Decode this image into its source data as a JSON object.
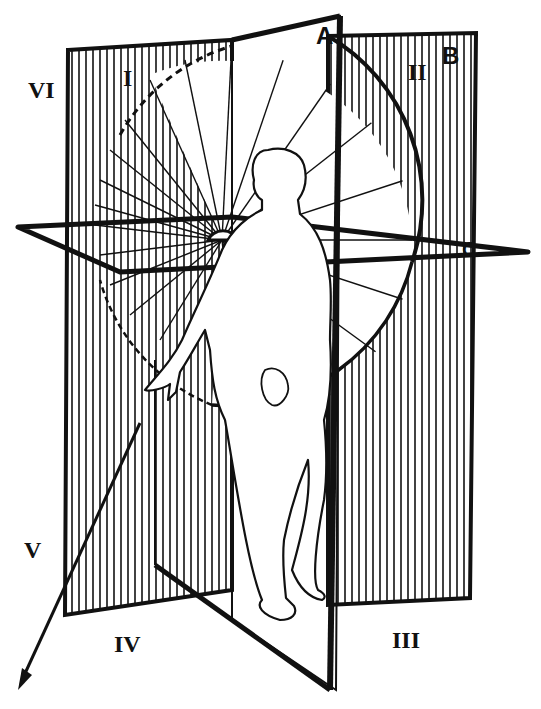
{
  "diagram": {
    "type": "anatomical-planes",
    "colors": {
      "ink": "#111111",
      "paper": "#ffffff"
    },
    "planes": [
      {
        "id": "A",
        "label": "A",
        "name": "sagittal-plane"
      },
      {
        "id": "B",
        "label": "B",
        "name": "frontal-plane"
      },
      {
        "id": "C",
        "label": "C",
        "name": "horizontal-plane"
      }
    ],
    "quadrants": [
      {
        "id": "I",
        "label": "I"
      },
      {
        "id": "II",
        "label": "II"
      },
      {
        "id": "III",
        "label": "III"
      },
      {
        "id": "IV",
        "label": "IV"
      },
      {
        "id": "V",
        "label": "V"
      },
      {
        "id": "VI",
        "label": "VI"
      }
    ],
    "elements": [
      "human-figure",
      "radial-fan-of-lines",
      "dashed-arc",
      "pointing-arrow"
    ]
  }
}
